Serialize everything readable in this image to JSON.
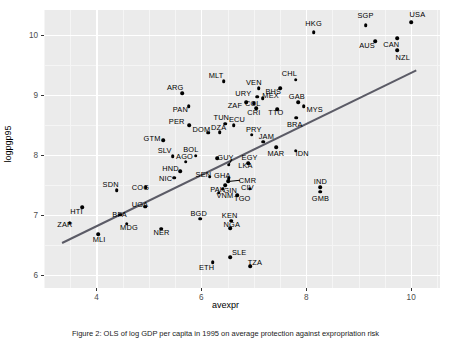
{
  "chart_data": {
    "type": "scatter",
    "title": "",
    "xlabel": "avexpr",
    "ylabel": "logpgp95",
    "xlim": [
      3.0,
      10.55
    ],
    "ylim": [
      5.78,
      10.42
    ],
    "xticks": [
      4,
      6,
      8,
      10
    ],
    "yticks": [
      6,
      7,
      8,
      9,
      10
    ],
    "grid": true,
    "legend": null,
    "fit_line": {
      "label": "linear fit",
      "color": "#5b5b66",
      "x": [
        3.35,
        10.1
      ],
      "y": [
        6.55,
        9.43
      ]
    },
    "points": [
      {
        "label": "HKG",
        "x": 8.14,
        "y": 10.05,
        "lx": 8.14,
        "ly": 10.2
      },
      {
        "label": "SGP",
        "x": 9.13,
        "y": 10.17,
        "lx": 9.13,
        "ly": 10.33
      },
      {
        "label": "USA",
        "x": 10.0,
        "y": 10.22,
        "lx": 10.12,
        "ly": 10.36
      },
      {
        "label": "AUS",
        "x": 9.32,
        "y": 9.9,
        "lx": 9.16,
        "ly": 9.84
      },
      {
        "label": "CAN",
        "x": 9.73,
        "y": 9.95,
        "lx": 9.62,
        "ly": 9.86
      },
      {
        "label": "NZL",
        "x": 9.73,
        "y": 9.75,
        "lx": 9.84,
        "ly": 9.64
      },
      {
        "label": "MLT",
        "x": 6.43,
        "y": 9.23,
        "lx": 6.28,
        "ly": 9.34
      },
      {
        "label": "CHL",
        "x": 7.8,
        "y": 9.26,
        "lx": 7.68,
        "ly": 9.37
      },
      {
        "label": "BHS",
        "x": 7.5,
        "y": 9.11,
        "lx": 7.37,
        "ly": 9.06
      },
      {
        "label": "VEN",
        "x": 7.09,
        "y": 9.11,
        "lx": 7.0,
        "ly": 9.21
      },
      {
        "label": "ARG",
        "x": 5.64,
        "y": 9.03,
        "lx": 5.5,
        "ly": 9.14
      },
      {
        "label": "URY",
        "x": 7.06,
        "y": 8.97,
        "lx": 6.8,
        "ly": 9.03
      },
      {
        "label": "MEX",
        "x": 7.17,
        "y": 8.95,
        "lx": 7.32,
        "ly": 9.0
      },
      {
        "label": "GAB",
        "x": 7.85,
        "y": 8.88,
        "lx": 7.82,
        "ly": 8.99
      },
      {
        "label": "ZAF",
        "x": 6.86,
        "y": 8.88,
        "lx": 6.64,
        "ly": 8.84
      },
      {
        "label": "COL",
        "x": 7.0,
        "y": 8.86,
        "lx": 6.98,
        "ly": 8.87
      },
      {
        "label": "MYS",
        "x": 7.95,
        "y": 8.81,
        "lx": 8.16,
        "ly": 8.76
      },
      {
        "label": "PAN",
        "x": 5.76,
        "y": 8.81,
        "lx": 5.6,
        "ly": 8.76
      },
      {
        "label": "CRI",
        "x": 7.05,
        "y": 8.78,
        "lx": 7.0,
        "ly": 8.72
      },
      {
        "label": "TTO",
        "x": 7.45,
        "y": 8.76,
        "lx": 7.42,
        "ly": 8.71
      },
      {
        "label": "PER",
        "x": 5.77,
        "y": 8.5,
        "lx": 5.53,
        "ly": 8.56
      },
      {
        "label": "TUN",
        "x": 6.45,
        "y": 8.52,
        "lx": 6.38,
        "ly": 8.63
      },
      {
        "label": "ECU",
        "x": 6.62,
        "y": 8.5,
        "lx": 6.68,
        "ly": 8.6
      },
      {
        "label": "BRA",
        "x": 7.81,
        "y": 8.62,
        "lx": 7.78,
        "ly": 8.52
      },
      {
        "label": "DOM",
        "x": 6.13,
        "y": 8.37,
        "lx": 6.0,
        "ly": 8.43
      },
      {
        "label": "DZA",
        "x": 6.35,
        "y": 8.38,
        "lx": 6.33,
        "ly": 8.46
      },
      {
        "label": "PRY",
        "x": 6.96,
        "y": 8.34,
        "lx": 7.0,
        "ly": 8.44
      },
      {
        "label": "GTM",
        "x": 5.27,
        "y": 8.25,
        "lx": 5.06,
        "ly": 8.28
      },
      {
        "label": "JAM",
        "x": 7.18,
        "y": 8.22,
        "lx": 7.24,
        "ly": 8.32
      },
      {
        "label": "IDN",
        "x": 7.8,
        "y": 8.07,
        "lx": 7.92,
        "ly": 8.04
      },
      {
        "label": "MAR",
        "x": 7.43,
        "y": 8.13,
        "lx": 7.42,
        "ly": 8.04
      },
      {
        "label": "SLV",
        "x": 5.45,
        "y": 7.98,
        "lx": 5.3,
        "ly": 8.09
      },
      {
        "label": "BOL",
        "x": 5.89,
        "y": 7.99,
        "lx": 5.8,
        "ly": 8.1
      },
      {
        "label": "GUY",
        "x": 6.3,
        "y": 7.95,
        "lx": 6.46,
        "ly": 7.96
      },
      {
        "label": "AGO",
        "x": 5.7,
        "y": 7.89,
        "lx": 5.68,
        "ly": 7.99
      },
      {
        "label": "EGY",
        "x": 6.89,
        "y": 7.86,
        "lx": 6.92,
        "ly": 7.96
      },
      {
        "label": "LKA",
        "x": 6.52,
        "y": 7.84,
        "lx": 6.84,
        "ly": 7.84
      },
      {
        "label": "HND",
        "x": 5.6,
        "y": 7.73,
        "lx": 5.41,
        "ly": 7.78
      },
      {
        "label": "SEN",
        "x": 6.16,
        "y": 7.64,
        "lx": 6.04,
        "ly": 7.69
      },
      {
        "label": "GHA",
        "x": 6.52,
        "y": 7.61,
        "lx": 6.4,
        "ly": 7.66
      },
      {
        "label": "CMR",
        "x": 6.51,
        "y": 7.56,
        "lx": 6.88,
        "ly": 7.58
      },
      {
        "label": "NIC",
        "x": 5.48,
        "y": 7.62,
        "lx": 5.32,
        "ly": 7.62
      },
      {
        "label": "CIV",
        "x": 6.92,
        "y": 7.44,
        "lx": 6.88,
        "ly": 7.47
      },
      {
        "label": "IND",
        "x": 8.27,
        "y": 7.46,
        "lx": 8.27,
        "ly": 7.56
      },
      {
        "label": "GMB",
        "x": 8.27,
        "y": 7.39,
        "lx": 8.27,
        "ly": 7.29
      },
      {
        "label": "PAK",
        "x": 6.46,
        "y": 7.5,
        "lx": 6.31,
        "ly": 7.44
      },
      {
        "label": "GIN",
        "x": 6.41,
        "y": 7.44,
        "lx": 6.55,
        "ly": 7.42
      },
      {
        "label": "VNM",
        "x": 6.33,
        "y": 7.37,
        "lx": 6.45,
        "ly": 7.33
      },
      {
        "label": "TGO",
        "x": 6.68,
        "y": 7.33,
        "lx": 6.78,
        "ly": 7.29
      },
      {
        "label": "SDN",
        "x": 4.39,
        "y": 7.41,
        "lx": 4.27,
        "ly": 7.52
      },
      {
        "label": "COG",
        "x": 4.94,
        "y": 7.46,
        "lx": 4.84,
        "ly": 7.47
      },
      {
        "label": "UGA",
        "x": 4.93,
        "y": 7.14,
        "lx": 4.83,
        "ly": 7.19
      },
      {
        "label": "HTI",
        "x": 3.73,
        "y": 7.13,
        "lx": 3.62,
        "ly": 7.06
      },
      {
        "label": "BFA",
        "x": 4.45,
        "y": 7.0,
        "lx": 4.44,
        "ly": 7.01
      },
      {
        "label": "ZAR",
        "x": 3.49,
        "y": 6.87,
        "lx": 3.4,
        "ly": 6.85
      },
      {
        "label": "MDG",
        "x": 4.58,
        "y": 6.85,
        "lx": 4.62,
        "ly": 6.8
      },
      {
        "label": "BGD",
        "x": 5.98,
        "y": 6.94,
        "lx": 5.95,
        "ly": 7.03
      },
      {
        "label": "KEN",
        "x": 6.57,
        "y": 6.9,
        "lx": 6.54,
        "ly": 7.0
      },
      {
        "label": "NGA",
        "x": 6.55,
        "y": 6.78,
        "lx": 6.58,
        "ly": 6.85
      },
      {
        "label": "NER",
        "x": 5.24,
        "y": 6.77,
        "lx": 5.24,
        "ly": 6.72
      },
      {
        "label": "MLI",
        "x": 4.03,
        "y": 6.68,
        "lx": 4.05,
        "ly": 6.6
      },
      {
        "label": "SLE",
        "x": 6.55,
        "y": 6.29,
        "lx": 6.72,
        "ly": 6.38
      },
      {
        "label": "ETH",
        "x": 6.22,
        "y": 6.21,
        "lx": 6.1,
        "ly": 6.13
      },
      {
        "label": "TZA",
        "x": 6.93,
        "y": 6.14,
        "lx": 7.02,
        "ly": 6.22
      }
    ],
    "leaders": [
      {
        "from_label": "GUY",
        "to_x": 6.52,
        "to_y": 7.84,
        "from_x": 6.58,
        "from_y": 7.93
      },
      {
        "from_label": "CMR",
        "to_x": 6.51,
        "to_y": 7.56,
        "from_x": 6.73,
        "from_y": 7.58
      }
    ]
  },
  "caption": "Figure 2: OLS of log GDP per capita in 1995 on average protection against expropriation risk"
}
